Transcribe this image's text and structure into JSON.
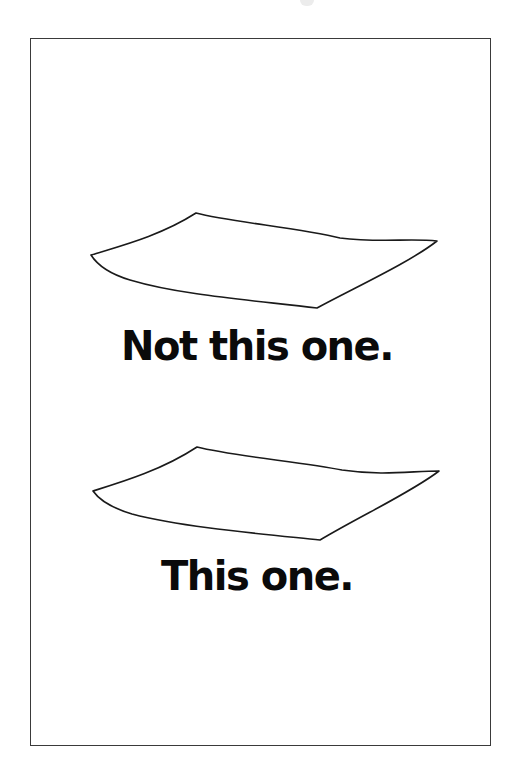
{
  "poster": {
    "caption_top": "Not this one.",
    "caption_bottom": "This one."
  },
  "sketches": [
    {
      "name": "sheet-top",
      "corners": {
        "left": [
          91,
          255
        ],
        "top": [
          196,
          213
        ],
        "right": [
          437,
          241
        ],
        "bottom": [
          317,
          308
        ]
      }
    },
    {
      "name": "sheet-bottom",
      "corners": {
        "left": [
          93,
          491
        ],
        "top": [
          197,
          447
        ],
        "right": [
          439,
          471
        ],
        "bottom": [
          320,
          540
        ]
      }
    }
  ],
  "colors": {
    "ink": "#0a0a0a",
    "frame": "#3a3a3a",
    "background": "#ffffff"
  }
}
